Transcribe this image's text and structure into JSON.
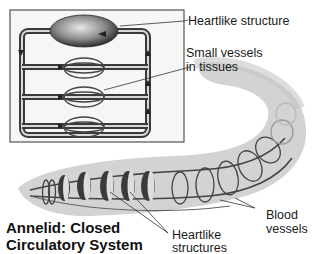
{
  "title": {
    "line1": "Annelid: Closed",
    "line2": "Circulatory System"
  },
  "labels": {
    "heartlike_structure": "Heartlike structure",
    "small_vessels_line1": "Small vessels",
    "small_vessels_line2": "in tissues",
    "blood_vessels_line1": "Blood",
    "blood_vessels_line2": "vessels",
    "heartlike_structures_line1": "Heartlike",
    "heartlike_structures_line2": "structures"
  },
  "colors": {
    "background": "#ffffff",
    "vessel": "#555555",
    "body": "#d4d4d4",
    "heart": "#3a3a3a",
    "text": "#1a1a1a"
  }
}
